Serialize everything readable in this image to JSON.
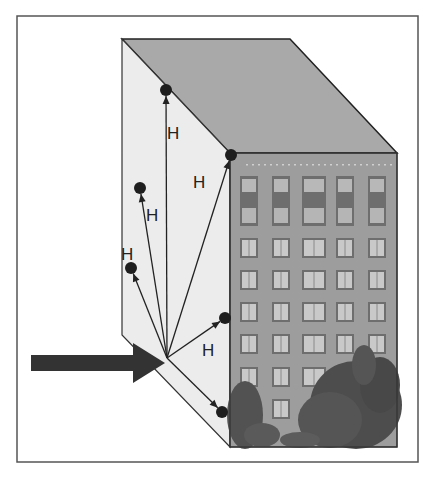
{
  "diagram": {
    "frame": {
      "x": 17,
      "y": 16,
      "w": 401,
      "h": 446,
      "stroke": "#555555"
    },
    "colors": {
      "left_face": "#ececec",
      "top_face": "#a9a9a9",
      "facade": "#9a9a9a",
      "window_frame": "#6e6e6e",
      "window_glass": "#c9c9c9",
      "tree": "#4a4a4a",
      "edge": "#222222",
      "dot": "#1e1e1e",
      "input_arrow": "#333333"
    },
    "origin": {
      "x": 167,
      "y": 358
    },
    "input_arrow": {
      "from_x": 31,
      "y": 363,
      "to_x": 165,
      "shaft_half": 8,
      "head_half": 20,
      "head_len": 32
    },
    "rays": [
      {
        "id": "ray-top-vertical",
        "to": [
          166,
          90
        ],
        "label": "H",
        "label_pos": [
          167,
          139
        ]
      },
      {
        "id": "ray-top-corner",
        "to": [
          231,
          155
        ],
        "label": "H",
        "label_pos": [
          193,
          188
        ]
      },
      {
        "id": "ray-upper-left",
        "to": [
          140,
          188
        ],
        "label": "H",
        "label_pos": [
          146,
          221
        ]
      },
      {
        "id": "ray-left",
        "to": [
          131,
          268
        ],
        "label": "H",
        "label_pos": [
          121,
          260
        ]
      },
      {
        "id": "ray-right",
        "to": [
          225,
          318
        ],
        "label": "H",
        "label_pos": [
          202,
          356
        ]
      },
      {
        "id": "ray-lower-right",
        "to": [
          222,
          412
        ],
        "label": "",
        "label_pos": [
          0,
          0
        ]
      }
    ],
    "facade": {
      "columns": 5,
      "rows": 7,
      "tall_top_row": true
    }
  }
}
